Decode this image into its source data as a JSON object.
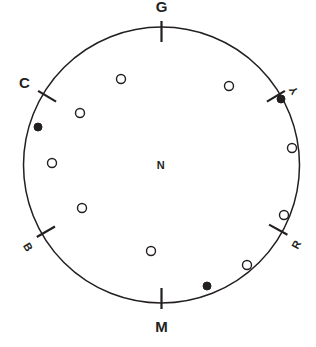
{
  "figure": {
    "background_color": "#ffffff",
    "ink_color": "#231f20"
  },
  "chart_data": {
    "type": "scatter",
    "subtitle": "",
    "xlabel": "",
    "ylabel": "",
    "coordinate_system": "polar",
    "grid": false,
    "legend_position": "none",
    "circle": {
      "center_x": 161.5,
      "center_y": 165.0,
      "radius": 138.0,
      "stroke_color": "#231f20",
      "stroke_width": 1.5
    },
    "axis_labels": [
      {
        "text": "G",
        "name": "green",
        "angle_deg": 90,
        "tick": true,
        "label_radius": 158,
        "style": "major"
      },
      {
        "text": "Y",
        "name": "yellow",
        "angle_deg": 31,
        "tick": true,
        "label_radius": 158,
        "style": "minor"
      },
      {
        "text": "R",
        "name": "red",
        "angle_deg": -29,
        "tick": true,
        "label_radius": 158,
        "style": "minor"
      },
      {
        "text": "M",
        "name": "magenta",
        "angle_deg": -90,
        "tick": true,
        "label_radius": 162,
        "style": "major"
      },
      {
        "text": "B",
        "name": "blue",
        "angle_deg": -150,
        "tick": true,
        "label_radius": 158,
        "style": "minor"
      },
      {
        "text": "C",
        "name": "cyan",
        "angle_deg": 149,
        "tick": true,
        "label_radius": 160,
        "style": "major"
      }
    ],
    "center_label": {
      "text": "N",
      "name": "neutral",
      "x": 161,
      "y": 165
    },
    "points": [
      {
        "x": 121,
        "y": 79,
        "marker": "open",
        "radius_px": 4.5
      },
      {
        "x": 229,
        "y": 86,
        "marker": "open",
        "radius_px": 4.5
      },
      {
        "x": 80,
        "y": 113,
        "marker": "open",
        "radius_px": 4.5
      },
      {
        "x": 38,
        "y": 127,
        "marker": "filled",
        "radius_px": 4.5
      },
      {
        "x": 281,
        "y": 99,
        "marker": "filled",
        "radius_px": 4.5
      },
      {
        "x": 292,
        "y": 148,
        "marker": "open",
        "radius_px": 4.5
      },
      {
        "x": 52,
        "y": 163,
        "marker": "open",
        "radius_px": 4.5
      },
      {
        "x": 82,
        "y": 208,
        "marker": "open",
        "radius_px": 4.5
      },
      {
        "x": 284,
        "y": 215,
        "marker": "open",
        "radius_px": 4.5
      },
      {
        "x": 151,
        "y": 251,
        "marker": "open",
        "radius_px": 4.5
      },
      {
        "x": 247,
        "y": 265,
        "marker": "open",
        "radius_px": 4.5
      },
      {
        "x": 207,
        "y": 286,
        "marker": "filled",
        "radius_px": 4.5
      }
    ],
    "marker_legend": {
      "open": "open circle",
      "filled": "filled circle"
    }
  }
}
